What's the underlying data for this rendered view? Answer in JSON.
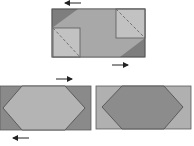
{
  "figure": {
    "colors": {
      "background": "#ffffff",
      "light_fabric": "#b4b4b4",
      "medium_fabric": "#9e9e9e",
      "dark_fabric": "#7e7e7e",
      "fold_square": "#c2c2c2",
      "outline": "#5a5a5a",
      "dashed_line": "#6a6a6a",
      "arrow": "#222222"
    },
    "panels": [
      {
        "id": "top",
        "label": "top-panel-with-folded-squares"
      },
      {
        "id": "bottom-left",
        "label": "bottom-left-panel-light-hexagon"
      },
      {
        "id": "bottom-right",
        "label": "bottom-right-panel-dark-hexagon"
      }
    ],
    "arrows": [
      {
        "id": "top-left-arrow",
        "direction": "left"
      },
      {
        "id": "top-right-arrow",
        "direction": "right"
      },
      {
        "id": "middle-arrow",
        "direction": "right"
      },
      {
        "id": "bottom-arrow",
        "direction": "left"
      }
    ]
  }
}
